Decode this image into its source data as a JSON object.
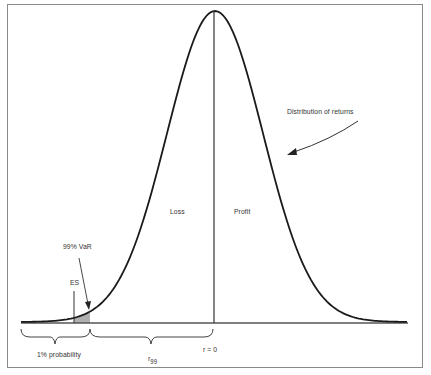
{
  "diagram": {
    "type": "normal-distribution-var",
    "curve": {
      "center_x": 215,
      "peak_y": 11,
      "baseline_y": 322,
      "sigma_px": 48
    },
    "labels": {
      "distribution": "Distribution of returns",
      "loss": "Loss",
      "profit": "Profit",
      "var": "99% VaR",
      "es": "ES",
      "one_pct": "1% probability",
      "r99_main": "r",
      "r99_sub": "99",
      "r_zero": "r = 0"
    },
    "colors": {
      "curve": "#1a1a1a",
      "frame": "#8a8a8a",
      "shade": "#b0b0b0",
      "baseline": "#555555"
    }
  }
}
